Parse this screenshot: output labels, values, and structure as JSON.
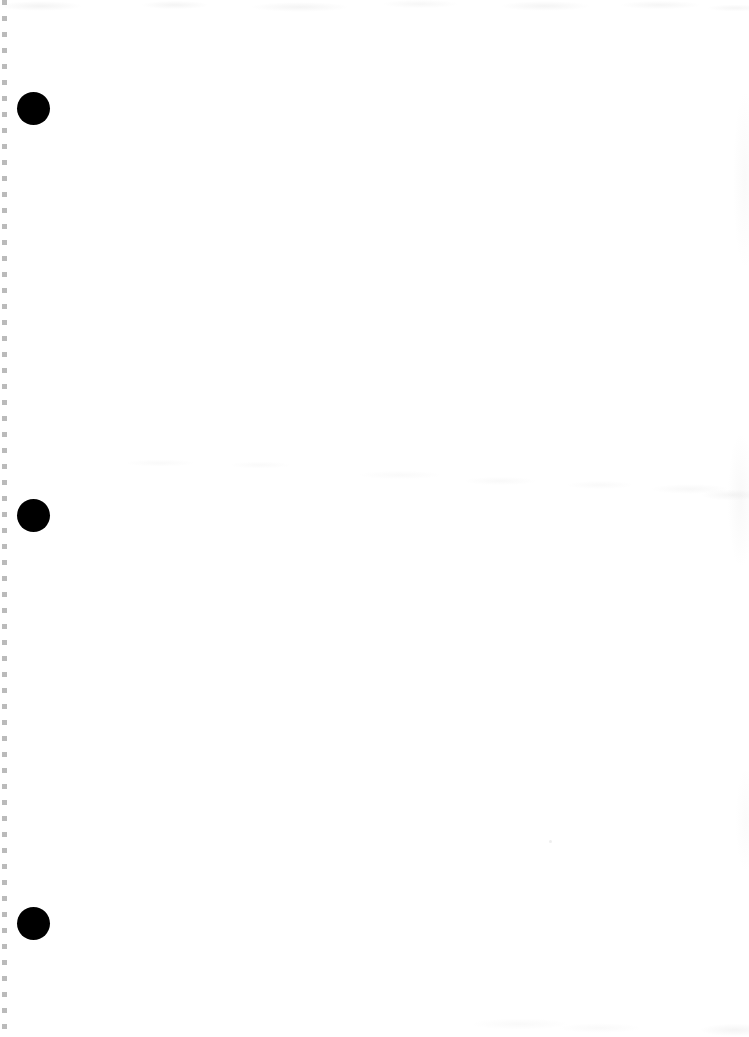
{
  "page": {
    "kind": "scanned-blank-page",
    "width": 749,
    "height": 1037,
    "background_color": "#ffffff",
    "body_text": "",
    "visible_text": "none"
  },
  "edge_artifact": {
    "name": "left-margin-dashed-artifact",
    "color": "#828282",
    "x": 2,
    "width": 5,
    "dash_length": 5,
    "dash_gap": 11
  },
  "markers": {
    "color": "#000000",
    "diameter": 33,
    "items": [
      {
        "label": "",
        "cx": 33,
        "cy": 108
      },
      {
        "label": "",
        "cx": 33,
        "cy": 515
      },
      {
        "label": "",
        "cx": 33,
        "cy": 923
      }
    ]
  },
  "specks": [
    {
      "x": 549,
      "y": 840
    }
  ],
  "noise": {
    "color": "#969696",
    "regions": [
      "top",
      "middle-band",
      "bottom",
      "right"
    ]
  }
}
